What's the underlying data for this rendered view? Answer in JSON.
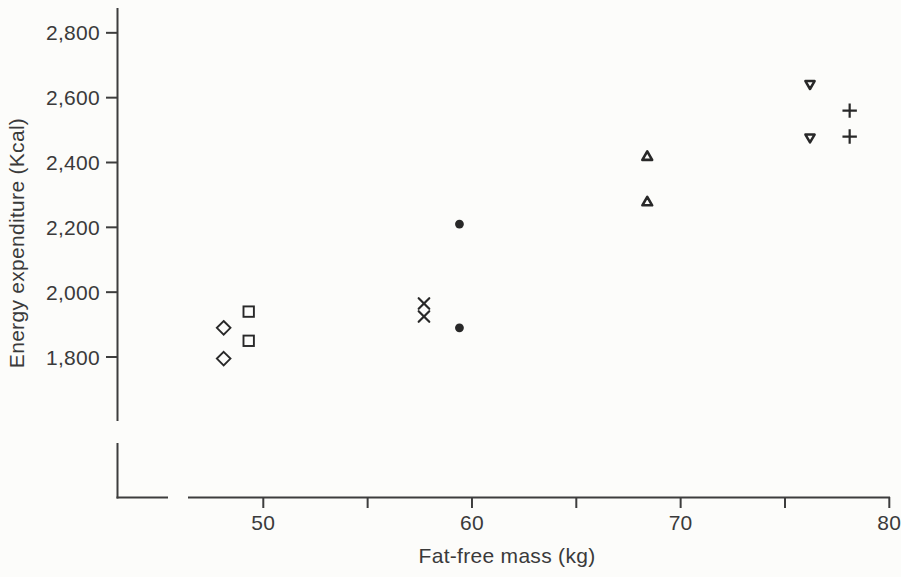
{
  "figure": {
    "background": "#fcfcfa"
  },
  "chart_data": {
    "type": "scatter",
    "title": "",
    "xlabel": "Fat-free mass (kg)",
    "ylabel": "Energy expenditure (Kcal)",
    "xlim": [
      46,
      80
    ],
    "ylim": [
      1700,
      2870
    ],
    "grid": false,
    "legend_position": "none",
    "axis_break_near_origin": true,
    "axis_color": "#3d3d3d",
    "label_color": "#3a3a3a",
    "marker_color": "#282828",
    "x_ticks": [
      {
        "value": 50,
        "label": "50"
      },
      {
        "value": 55,
        "label": ""
      },
      {
        "value": 60,
        "label": "60"
      },
      {
        "value": 65,
        "label": ""
      },
      {
        "value": 70,
        "label": "70"
      },
      {
        "value": 75,
        "label": ""
      },
      {
        "value": 80,
        "label": "80"
      }
    ],
    "y_ticks": [
      {
        "value": 1800,
        "label": "1,800"
      },
      {
        "value": 2000,
        "label": "2,000"
      },
      {
        "value": 2200,
        "label": "2,200"
      },
      {
        "value": 2400,
        "label": "2,400"
      },
      {
        "value": 2600,
        "label": "2,600"
      },
      {
        "value": 2800,
        "label": "2,800"
      }
    ],
    "series": [
      {
        "name": "open-diamond",
        "marker": "diamond",
        "points": [
          [
            48.1,
            1890
          ],
          [
            48.1,
            1795
          ]
        ]
      },
      {
        "name": "open-square",
        "marker": "square",
        "points": [
          [
            49.3,
            1940
          ],
          [
            49.3,
            1850
          ]
        ]
      },
      {
        "name": "x-cross",
        "marker": "x",
        "points": [
          [
            57.7,
            1965
          ],
          [
            57.7,
            1925
          ]
        ]
      },
      {
        "name": "filled-circle",
        "marker": "circle-filled",
        "points": [
          [
            59.4,
            2210
          ],
          [
            59.4,
            1890
          ]
        ]
      },
      {
        "name": "small-triangle-up",
        "marker": "triangle-up",
        "points": [
          [
            68.4,
            2420
          ],
          [
            68.4,
            2280
          ]
        ]
      },
      {
        "name": "small-triangle-down",
        "marker": "triangle-down",
        "points": [
          [
            76.2,
            2640
          ],
          [
            76.2,
            2475
          ]
        ]
      },
      {
        "name": "plus-sign",
        "marker": "plus",
        "points": [
          [
            78.1,
            2560
          ],
          [
            78.1,
            2480
          ]
        ]
      }
    ]
  }
}
